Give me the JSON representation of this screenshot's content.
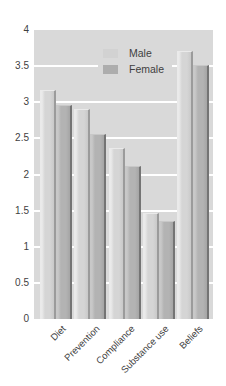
{
  "chart_data": {
    "type": "bar",
    "title": "",
    "xlabel": "",
    "ylabel": "",
    "categories": [
      "Diet",
      "Prevention",
      "Compliance",
      "Substance use",
      "Beliefs"
    ],
    "series": [
      {
        "name": "Male",
        "values": [
          3.15,
          2.9,
          2.35,
          1.45,
          3.7
        ]
      },
      {
        "name": "Female",
        "values": [
          2.95,
          2.55,
          2.1,
          1.35,
          3.5
        ]
      }
    ],
    "ylim": [
      0,
      4
    ],
    "yticks": [
      0,
      0.5,
      1,
      1.5,
      2,
      2.5,
      3,
      3.5,
      4
    ],
    "grid": true,
    "gridline_color": "#ffffff",
    "legend_position": "inside-top-center",
    "xtick_rotation_deg": 45
  },
  "legend": {
    "items": [
      {
        "label": "Male",
        "color": "#d2d2d2"
      },
      {
        "label": "Female",
        "color": "#adadad"
      }
    ]
  },
  "colors": {
    "page_bg": "#ffffff",
    "plot_bg": "#d9d9d9",
    "gridline": "#ffffff",
    "text": "#3f3f3f",
    "male_bar": "#d5d5d5",
    "male_bar_highlight": "#eaeaea",
    "male_bar_shade": "#c9c9c9",
    "male_bar_edge": "#9b9b9b",
    "female_bar": "#b3b3b3",
    "female_bar_highlight": "#c8c8c8",
    "female_bar_shade": "#a5a5a5",
    "female_bar_edge": "#747474"
  }
}
